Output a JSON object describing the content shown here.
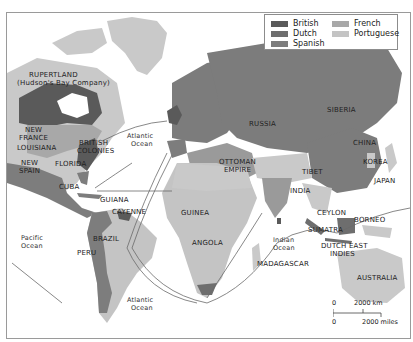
{
  "legend": {
    "items": [
      {
        "label": "British",
        "color": "#5a5a5a"
      },
      {
        "label": "Dutch",
        "color": "#6e6e6e"
      },
      {
        "label": "Spanish",
        "color": "#7d7d7d"
      },
      {
        "label": "French",
        "color": "#a8a8a8"
      },
      {
        "label": "Portuguese",
        "color": "#c4c4c4"
      }
    ]
  },
  "colors": {
    "land_unclaimed": "#c9c9c9",
    "water": "#ffffff",
    "route": "#6a6a6a",
    "russia": "#7c7c7c",
    "ottoman": "#9a9a9a"
  },
  "labels": {
    "rupertland": "RUPERTLAND",
    "hudsons_bay": "(Hudson's Bay Company)",
    "new_france_1": "NEW",
    "new_france_2": "FRANCE",
    "louisiana": "LOUISIANA",
    "british_colonies_1": "BRITISH",
    "british_colonies_2": "COLONIES",
    "new_spain_1": "NEW",
    "new_spain_2": "SPAIN",
    "florida": "FLORIDA",
    "cuba": "CUBA",
    "guiana": "GUIANA",
    "cayenne": "CAYENNE",
    "brazil": "BRAZIL",
    "peru": "PERU",
    "guinea": "GUINEA",
    "angola": "ANGOLA",
    "madagascar": "MADAGASCAR",
    "russia": "RUSSIA",
    "siberia": "SIBERIA",
    "ottoman_1": "OTTOMAN",
    "ottoman_2": "EMPIRE",
    "tibet": "TIBET",
    "india": "INDIA",
    "china": "CHINA",
    "korea": "KOREA",
    "japan": "JAPAN",
    "ceylon": "CEYLON",
    "borneo": "BORNEO",
    "sumatra": "SUMATRA",
    "dutch_east_1": "DUTCH EAST",
    "dutch_east_2": "INDIES",
    "australia": "AUSTRALIA"
  },
  "oceans": {
    "atlantic_north_1": "Atlantic",
    "atlantic_north_2": "Ocean",
    "atlantic_south_1": "Atlantic",
    "atlantic_south_2": "Ocean",
    "pacific_1": "Pacific",
    "pacific_2": "Ocean",
    "indian_1": "Indian",
    "indian_2": "Ocean"
  },
  "scale": {
    "zero_top": "0",
    "km": "2000 km",
    "zero_bottom": "0",
    "miles": "2000 miles"
  }
}
